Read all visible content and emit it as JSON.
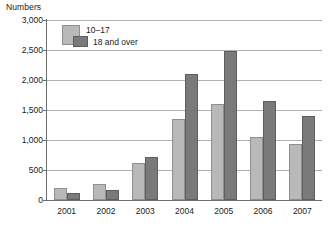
{
  "chart_data": {
    "type": "bar",
    "title": "Numbers",
    "ylabel": "Numbers",
    "xlabel": "",
    "categories": [
      "2001",
      "2002",
      "2003",
      "2004",
      "2005",
      "2006",
      "2007"
    ],
    "series": [
      {
        "name": "10–17",
        "color": "#b9b9b9",
        "values": [
          200,
          270,
          620,
          1350,
          1600,
          1050,
          930
        ]
      },
      {
        "name": "18 and over",
        "color": "#7a7a7a",
        "values": [
          120,
          160,
          720,
          2100,
          2490,
          1650,
          1400
        ]
      }
    ],
    "ylim": [
      0,
      3000
    ],
    "ytick_values": [
      0,
      500,
      1000,
      1500,
      2000,
      2500,
      3000
    ],
    "ytick_labels": [
      "0",
      "500",
      "1,000",
      "1,500",
      "2,000",
      "2,500",
      "3,000"
    ],
    "grid": true,
    "legend_position": "top-left"
  }
}
